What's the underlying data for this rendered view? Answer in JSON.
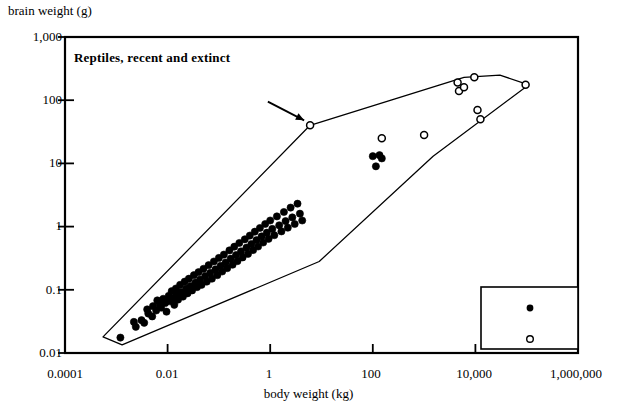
{
  "axes": {
    "ylabel": "brain weight (g)",
    "xlabel": "body weight (kg)",
    "yticks": [
      "1,000",
      "100",
      "10",
      "1",
      "0.1",
      "0.01"
    ],
    "xticks": [
      "0.0001",
      "0.01",
      "1",
      "100",
      "10,000",
      "1,000,000"
    ]
  },
  "title": "Reptiles, recent and extinct",
  "legend": {
    "items": [
      {
        "label": "recent reptiles",
        "marker": "filled-circle"
      },
      {
        "label": "dinosaurs",
        "marker": "open-circle"
      }
    ]
  },
  "colors": {
    "ink": "#000000",
    "background": "#ffffff"
  },
  "chart_data": {
    "type": "scatter",
    "title": "Reptiles, recent and extinct",
    "xlabel": "body weight (kg)",
    "ylabel": "brain weight (g)",
    "xscale": "log",
    "yscale": "log",
    "xlim": [
      0.0001,
      1000000
    ],
    "ylim": [
      0.01,
      1000
    ],
    "grid": false,
    "legend_position": "bottom-right",
    "annotations": [
      {
        "type": "arrow",
        "text": "",
        "points_to_x": 6.0,
        "points_to_y": 40.0,
        "tail_x": 0.9,
        "tail_y": 95.0
      }
    ],
    "hulls": [
      {
        "name": "overall-envelope",
        "note": "single outline enclosing recent reptiles and dinosaurs",
        "vertices_xy": [
          [
            0.00055,
            0.018
          ],
          [
            6.0,
            40.0
          ],
          [
            6000.0,
            230.0
          ],
          [
            30000.0,
            250.0
          ],
          [
            110000.0,
            175.0
          ],
          [
            1500.0,
            13.0
          ],
          [
            9.0,
            0.28
          ],
          [
            0.0013,
            0.0135
          ]
        ]
      }
    ],
    "series": [
      {
        "name": "recent reptiles",
        "marker": "filled-circle",
        "points": [
          [
            0.0012,
            0.0175
          ],
          [
            0.0022,
            0.031
          ],
          [
            0.0024,
            0.026
          ],
          [
            0.0031,
            0.033
          ],
          [
            0.0035,
            0.03
          ],
          [
            0.004,
            0.049
          ],
          [
            0.0042,
            0.042
          ],
          [
            0.005,
            0.038
          ],
          [
            0.0052,
            0.055
          ],
          [
            0.006,
            0.047
          ],
          [
            0.0063,
            0.068
          ],
          [
            0.007,
            0.058
          ],
          [
            0.0075,
            0.052
          ],
          [
            0.0082,
            0.072
          ],
          [
            0.009,
            0.062
          ],
          [
            0.0095,
            0.045
          ],
          [
            0.0105,
            0.08
          ],
          [
            0.011,
            0.066
          ],
          [
            0.012,
            0.095
          ],
          [
            0.0125,
            0.073
          ],
          [
            0.0135,
            0.058
          ],
          [
            0.0145,
            0.105
          ],
          [
            0.015,
            0.085
          ],
          [
            0.016,
            0.07
          ],
          [
            0.0175,
            0.12
          ],
          [
            0.0185,
            0.092
          ],
          [
            0.02,
            0.078
          ],
          [
            0.0215,
            0.135
          ],
          [
            0.023,
            0.105
          ],
          [
            0.0245,
            0.088
          ],
          [
            0.026,
            0.15
          ],
          [
            0.028,
            0.115
          ],
          [
            0.03,
            0.098
          ],
          [
            0.0325,
            0.17
          ],
          [
            0.035,
            0.13
          ],
          [
            0.0375,
            0.11
          ],
          [
            0.04,
            0.19
          ],
          [
            0.043,
            0.145
          ],
          [
            0.046,
            0.12
          ],
          [
            0.05,
            0.215
          ],
          [
            0.054,
            0.165
          ],
          [
            0.058,
            0.135
          ],
          [
            0.063,
            0.245
          ],
          [
            0.068,
            0.185
          ],
          [
            0.073,
            0.15
          ],
          [
            0.08,
            0.28
          ],
          [
            0.086,
            0.21
          ],
          [
            0.093,
            0.17
          ],
          [
            0.1,
            0.32
          ],
          [
            0.108,
            0.24
          ],
          [
            0.116,
            0.195
          ],
          [
            0.125,
            0.36
          ],
          [
            0.135,
            0.27
          ],
          [
            0.145,
            0.22
          ],
          [
            0.16,
            0.42
          ],
          [
            0.17,
            0.31
          ],
          [
            0.185,
            0.25
          ],
          [
            0.2,
            0.48
          ],
          [
            0.215,
            0.355
          ],
          [
            0.23,
            0.285
          ],
          [
            0.25,
            0.55
          ],
          [
            0.27,
            0.405
          ],
          [
            0.29,
            0.325
          ],
          [
            0.32,
            0.63
          ],
          [
            0.345,
            0.465
          ],
          [
            0.37,
            0.37
          ],
          [
            0.4,
            0.72
          ],
          [
            0.43,
            0.53
          ],
          [
            0.465,
            0.425
          ],
          [
            0.5,
            0.83
          ],
          [
            0.54,
            0.61
          ],
          [
            0.58,
            0.485
          ],
          [
            0.63,
            0.95
          ],
          [
            0.68,
            0.7
          ],
          [
            0.73,
            0.56
          ],
          [
            0.8,
            1.1
          ],
          [
            0.86,
            0.8
          ],
          [
            0.93,
            0.64
          ],
          [
            1.0,
            1.25
          ],
          [
            1.1,
            0.92
          ],
          [
            1.2,
            0.73
          ],
          [
            1.35,
            1.45
          ],
          [
            1.5,
            1.05
          ],
          [
            1.65,
            0.84
          ],
          [
            1.85,
            1.7
          ],
          [
            2.0,
            1.22
          ],
          [
            2.2,
            0.96
          ],
          [
            2.5,
            2.0
          ],
          [
            2.7,
            1.4
          ],
          [
            3.0,
            1.1
          ],
          [
            3.4,
            2.3
          ],
          [
            3.8,
            1.6
          ],
          [
            4.2,
            1.25
          ],
          [
            100.0,
            13.0
          ],
          [
            135.0,
            13.5
          ],
          [
            150.0,
            12.0
          ],
          [
            115.0,
            9.0
          ]
        ]
      },
      {
        "name": "dinosaurs",
        "marker": "open-circle",
        "points": [
          [
            6.0,
            40.0
          ],
          [
            150.0,
            25.0
          ],
          [
            1000.0,
            28.0
          ],
          [
            4500.0,
            190.0
          ],
          [
            4800.0,
            140.0
          ],
          [
            6000.0,
            160.0
          ],
          [
            9500.0,
            230.0
          ],
          [
            11000.0,
            70.0
          ],
          [
            12500.0,
            50.0
          ],
          [
            95000.0,
            175.0
          ]
        ]
      }
    ]
  }
}
